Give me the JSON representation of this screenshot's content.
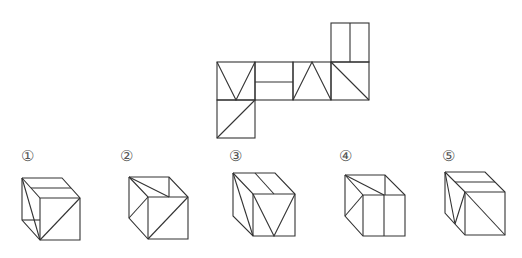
{
  "problem": {
    "type": "cube net folding",
    "net": {
      "squares": [
        {
          "id": "top",
          "x": 331,
          "y": 22,
          "size": 39,
          "pattern": "vertical-midline"
        },
        {
          "id": "row-1",
          "x": 217,
          "y": 62,
          "size": 38,
          "pattern": "V-shape"
        },
        {
          "id": "row-2",
          "x": 255,
          "y": 62,
          "size": 38,
          "pattern": "horizontal-midline"
        },
        {
          "id": "row-3",
          "x": 293,
          "y": 62,
          "size": 38,
          "pattern": "inverted-V-shape"
        },
        {
          "id": "row-4",
          "x": 331,
          "y": 62,
          "size": 38,
          "pattern": "diagonal-top-left-to-bottom-right"
        },
        {
          "id": "bottom",
          "x": 217,
          "y": 100,
          "size": 38,
          "pattern": "diagonal-bottom-left-to-top-right"
        }
      ]
    },
    "options": [
      {
        "number": 1,
        "label": "①",
        "label_x": 27,
        "label_y": 156
      },
      {
        "number": 2,
        "label": "②",
        "label_x": 126,
        "label_y": 156
      },
      {
        "number": 3,
        "label": "③",
        "label_x": 235,
        "label_y": 156
      },
      {
        "number": 4,
        "label": "④",
        "label_x": 345,
        "label_y": 156
      },
      {
        "number": 5,
        "label": "⑤",
        "label_x": 448,
        "label_y": 156
      }
    ]
  },
  "colors": {
    "stroke": "#333333",
    "label": "#555555",
    "background": "#ffffff"
  }
}
